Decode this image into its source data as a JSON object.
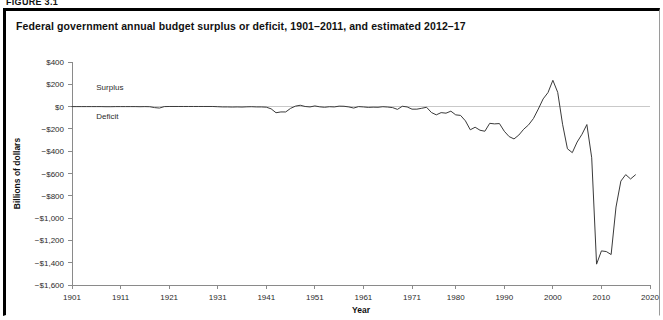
{
  "figure": {
    "number_label": "FIGURE 3.1",
    "title": "Federal government annual budget surplus or deficit, 1901–2011, and estimated 2012–17"
  },
  "chart_data": {
    "type": "line",
    "title": "Federal government annual budget surplus or deficit, 1901–2011, and estimated 2012–17",
    "xlabel": "Year",
    "ylabel": "Billions of dollars",
    "xlim": [
      1901,
      2020
    ],
    "ylim": [
      -1600,
      400
    ],
    "grid": false,
    "legend": "none",
    "zero_reference_line": true,
    "annotations": [
      {
        "text": "Surplus",
        "x": 1906,
        "y": 150,
        "note": "label above the zero line"
      },
      {
        "text": "Deficit",
        "x": 1906,
        "y": -110,
        "note": "label below the zero line"
      }
    ],
    "y_ticks": [
      400,
      200,
      0,
      -200,
      -400,
      -600,
      -800,
      -1000,
      -1200,
      -1400,
      -1600
    ],
    "y_tick_labels": [
      "$400",
      "$200",
      "$0",
      "−$200",
      "−$400",
      "−$600",
      "−$800",
      "−$1,000",
      "−$1,200",
      "−$1,400",
      "−$1,600"
    ],
    "x_ticks": [
      1901,
      1911,
      1921,
      1931,
      1941,
      1951,
      1961,
      1971,
      1980,
      1990,
      2000,
      2010,
      2020
    ],
    "x_tick_labels": [
      "1901",
      "1911",
      "1921",
      "1931",
      "1941",
      "1951",
      "1961",
      "1971",
      "1980",
      "1990",
      "2000",
      "2010",
      "2020"
    ],
    "series": [
      {
        "name": "Federal budget surplus or deficit",
        "x": [
          1901,
          1902,
          1903,
          1904,
          1905,
          1906,
          1907,
          1908,
          1909,
          1910,
          1911,
          1912,
          1913,
          1914,
          1915,
          1916,
          1917,
          1918,
          1919,
          1920,
          1921,
          1922,
          1923,
          1924,
          1925,
          1926,
          1927,
          1928,
          1929,
          1930,
          1931,
          1932,
          1933,
          1934,
          1935,
          1936,
          1937,
          1938,
          1939,
          1940,
          1941,
          1942,
          1943,
          1944,
          1945,
          1946,
          1947,
          1948,
          1949,
          1950,
          1951,
          1952,
          1953,
          1954,
          1955,
          1956,
          1957,
          1958,
          1959,
          1960,
          1961,
          1962,
          1963,
          1964,
          1965,
          1966,
          1967,
          1968,
          1969,
          1970,
          1971,
          1972,
          1973,
          1974,
          1975,
          1976,
          1977,
          1978,
          1979,
          1980,
          1981,
          1982,
          1983,
          1984,
          1985,
          1986,
          1987,
          1988,
          1989,
          1990,
          1991,
          1992,
          1993,
          1994,
          1995,
          1996,
          1997,
          1998,
          1999,
          2000,
          2001,
          2002,
          2003,
          2004,
          2005,
          2006,
          2007,
          2008,
          2009,
          2010,
          2011,
          2012,
          2013,
          2014,
          2015,
          2016,
          2017
        ],
        "values": [
          0,
          0,
          0,
          0,
          0,
          0,
          0,
          -1,
          -1,
          0,
          0,
          0,
          0,
          0,
          -1,
          0,
          -1,
          -9,
          -13,
          0,
          1,
          1,
          1,
          1,
          1,
          1,
          1,
          1,
          1,
          1,
          -1,
          -3,
          -3,
          -4,
          -3,
          -4,
          -2,
          -1,
          -3,
          -3,
          -5,
          -20,
          -55,
          -48,
          -48,
          -16,
          4,
          12,
          1,
          -3,
          6,
          -2,
          -6,
          -1,
          -3,
          4,
          3,
          -3,
          -13,
          0,
          -3,
          -7,
          -5,
          -6,
          -1,
          -4,
          -9,
          -25,
          3,
          -3,
          -23,
          -23,
          -15,
          -6,
          -53,
          -74,
          -54,
          -59,
          -41,
          -74,
          -79,
          -128,
          -208,
          -185,
          -212,
          -221,
          -150,
          -155,
          -152,
          -221,
          -269,
          -290,
          -255,
          -203,
          -164,
          -107,
          -22,
          69,
          126,
          236,
          128,
          -158,
          -378,
          -413,
          -318,
          -248,
          -161,
          -459,
          -1413,
          -1294,
          -1300,
          -1327,
          -901,
          -668,
          -610,
          -649,
          -612
        ]
      }
    ]
  },
  "axes": {
    "x_axis_title": "Year",
    "y_axis_title": "Billions of dollars"
  }
}
